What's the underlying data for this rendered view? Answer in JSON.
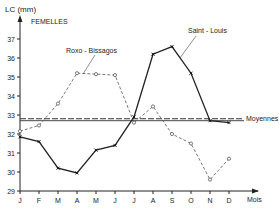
{
  "chart_data": {
    "type": "line",
    "title": "FEMELLES",
    "xlabel": "Mois",
    "ylabel": "LC (mm)",
    "categories": [
      "J",
      "F",
      "M",
      "A",
      "M",
      "J",
      "J",
      "A",
      "S",
      "O",
      "N",
      "D"
    ],
    "ylim": [
      29,
      37
    ],
    "yticks": [
      29,
      30,
      31,
      32,
      33,
      34,
      35,
      36,
      37
    ],
    "grid": false,
    "series": [
      {
        "name": "Saint-Louis",
        "style": "solid",
        "marker": "x",
        "values": [
          31.85,
          31.6,
          30.2,
          29.95,
          31.15,
          31.4,
          32.9,
          36.2,
          36.6,
          35.2,
          32.7,
          32.6
        ]
      },
      {
        "name": "Roxo-Bissagos",
        "style": "dashed",
        "marker": "circle-open",
        "values": [
          32.15,
          32.45,
          33.6,
          35.2,
          35.15,
          35.1,
          32.6,
          33.45,
          32.0,
          31.5,
          29.6,
          30.7
        ]
      }
    ],
    "reference_lines": {
      "label": "Moyennes",
      "lines": [
        {
          "series": "Roxo-Bissagos",
          "style": "dashed",
          "value": 32.8
        },
        {
          "series": "Saint-Louis",
          "style": "solid",
          "value": 32.7
        }
      ]
    },
    "annotations": [
      {
        "text": "Roxo-Bissagos",
        "points_to": "Roxo-Bissagos"
      },
      {
        "text": "Saint-Louis",
        "points_to": "Saint-Louis"
      }
    ]
  },
  "labels": {
    "y_axis": "LC (mm)",
    "panel": "FEMELLES",
    "x_axis": "Mois",
    "series_a": "Saint - Louis",
    "series_b": "Roxo - Bissagos",
    "means": "Moyennes"
  }
}
